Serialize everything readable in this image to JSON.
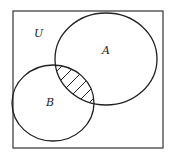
{
  "diagram": {
    "type": "venn",
    "universe_label": "U",
    "sets": [
      {
        "name": "A",
        "label": "A"
      },
      {
        "name": "B",
        "label": "B"
      }
    ],
    "shaded_region": "A ∩ B",
    "colors": {
      "stroke": "#222222",
      "background": "#ffffff",
      "hatch": "#222222"
    }
  }
}
